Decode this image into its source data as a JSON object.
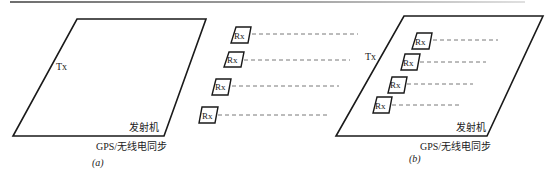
{
  "figure": {
    "panel_a": {
      "tx_label": "Tx",
      "transmitter_label": "发射机",
      "sync_label": "GPS/无线电同步",
      "caption": "(a)",
      "rx_labels": [
        "Rx",
        "Rx",
        "Rx",
        "Rx"
      ]
    },
    "panel_b": {
      "tx_label": "Tx",
      "transmitter_label": "发射机",
      "sync_label": "GPS/无线电同步",
      "caption": "(b)",
      "rx_labels": [
        "Rx",
        "Rx",
        "Rx",
        "Rx"
      ]
    },
    "colors": {
      "stroke": "#1a1a1a",
      "dash": "#555555",
      "rule": "#8a8a8a"
    }
  }
}
